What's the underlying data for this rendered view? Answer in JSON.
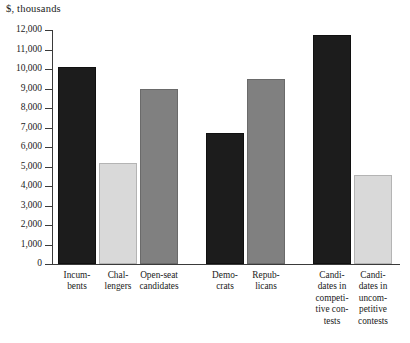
{
  "chart_data": {
    "type": "bar",
    "title": "",
    "ylabel": "$, thousands",
    "xlabel": "",
    "ylim": [
      0,
      12000
    ],
    "ytick_step": 1000,
    "yticks": [
      0,
      1000,
      2000,
      3000,
      4000,
      5000,
      6000,
      7000,
      8000,
      9000,
      10000,
      11000,
      12000
    ],
    "ytick_labels": [
      "0",
      "1,000",
      "2,000",
      "3,000",
      "4,000",
      "5,000",
      "6,000",
      "7,000",
      "8,000",
      "9,000",
      "10,000",
      "11,000",
      "12,000"
    ],
    "grid": false,
    "legend": "none",
    "categories": [
      "Incumbents",
      "Challengers",
      "Open-seat candidates",
      "Democrats",
      "Republicans",
      "Candidates in competitive contests",
      "Candidates in uncompetitive contests"
    ],
    "category_labels_wrapped": [
      "Incum-\nbents",
      "Chal-\nlengers",
      "Open-seat\ncandidates",
      "Demo-\ncrats",
      "Repub-\nlicans",
      "Candi-\ndates in\ncompeti-\ntive con-\ntests",
      "Candi-\ndates in\nuncom-\npetitive\ncontests"
    ],
    "values": [
      10100,
      5200,
      9000,
      6700,
      9500,
      11750,
      4550
    ],
    "bar_shades": [
      "dark",
      "light",
      "mid",
      "dark",
      "mid",
      "dark",
      "light"
    ],
    "groups": [
      {
        "name": "candidate-status",
        "category_indices": [
          0,
          1,
          2
        ]
      },
      {
        "name": "party",
        "category_indices": [
          3,
          4
        ]
      },
      {
        "name": "contest-competitiveness",
        "category_indices": [
          5,
          6
        ]
      }
    ]
  },
  "colors": {
    "dark": "#1c1c1c",
    "light": "#d9d9d9",
    "mid": "#808080",
    "axis": "#3a3a3a",
    "background": "#ffffff",
    "text": "#1a1a1a"
  }
}
